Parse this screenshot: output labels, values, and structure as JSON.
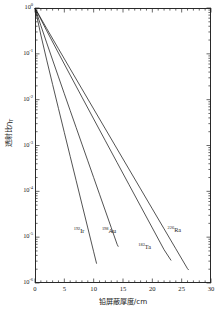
{
  "chart_data": {
    "type": "line",
    "title": "",
    "xlabel": "铅屏蔽厚度/cm",
    "ylabel": "透射比η",
    "ylabel_sub": "T",
    "xlim": [
      0,
      30
    ],
    "ylim": [
      1e-06,
      1
    ],
    "yscale": "log",
    "xscale": "linear",
    "grid": false,
    "legend_position": "inline-annotations",
    "xticks": [
      "0",
      "5",
      "10",
      "15",
      "20",
      "25",
      "30"
    ],
    "xtick_values": [
      0,
      5,
      10,
      15,
      20,
      25,
      30
    ],
    "yticks": [
      {
        "mantissa": "10",
        "exp": "0",
        "value": 1
      },
      {
        "mantissa": "10",
        "exp": "-1",
        "value": 0.1
      },
      {
        "mantissa": "10",
        "exp": "-2",
        "value": 0.01
      },
      {
        "mantissa": "10",
        "exp": "-3",
        "value": 0.001
      },
      {
        "mantissa": "10",
        "exp": "-4",
        "value": 0.0001
      },
      {
        "mantissa": "10",
        "exp": "-5",
        "value": 1e-05
      },
      {
        "mantissa": "10",
        "exp": "-6",
        "value": 1e-06
      }
    ],
    "series": [
      {
        "name": "Ir-192",
        "label_mass": "192",
        "label_element": "Ir",
        "label_x_cm": 6.6,
        "label_y_value": 1.3e-05,
        "x": [
          0,
          1,
          2,
          3,
          4,
          5,
          6,
          7,
          8,
          9,
          10,
          10.5
        ],
        "y": [
          1,
          0.257,
          0.073,
          0.0215,
          0.0064,
          0.00192,
          0.000578,
          0.0001745,
          5.27e-05,
          1.59e-05,
          4.8e-06,
          2.64e-06
        ]
      },
      {
        "name": "Au-198",
        "label_mass": "198",
        "label_element": "Au",
        "label_x_cm": 11.4,
        "label_y_value": 1.3e-05,
        "x": [
          0,
          1,
          2,
          3,
          4,
          5,
          6,
          7,
          8,
          9,
          10,
          11,
          12,
          13,
          14,
          14.2
        ],
        "y": [
          1,
          0.412,
          0.173,
          0.0735,
          0.0314,
          0.01345,
          0.00578,
          0.00249,
          0.001073,
          0.000463,
          0.0002,
          8.64e-05,
          3.73e-05,
          1.61e-05,
          6.97e-06,
          6.2e-06
        ]
      },
      {
        "name": "Ta-182",
        "label_mass": "182",
        "label_element": "Ta",
        "label_x_cm": 17.6,
        "label_y_value": 5.8e-06,
        "x": [
          0,
          2,
          4,
          6,
          8,
          10,
          12,
          14,
          16,
          18,
          20,
          22,
          23.2
        ],
        "y": [
          1,
          0.318,
          0.104,
          0.0343,
          0.01138,
          0.00379,
          0.001265,
          0.000423,
          0.0001415,
          4.74e-05,
          1.59e-05,
          5.33e-06,
          3.1e-06
        ]
      },
      {
        "name": "Ra-226",
        "label_mass": "226",
        "label_element": "Ra",
        "label_x_cm": 22.6,
        "label_y_value": 1.35e-05,
        "x": [
          0,
          2,
          4,
          6,
          8,
          10,
          12,
          14,
          16,
          18,
          20,
          22,
          24,
          26,
          26.2
        ],
        "y": [
          1,
          0.356,
          0.129,
          0.047,
          0.01715,
          0.00627,
          0.002295,
          0.00084,
          0.000308,
          0.0001129,
          4.14e-05,
          1.52e-05,
          5.58e-06,
          2.05e-06,
          1.92e-06
        ]
      }
    ]
  },
  "axes": {
    "x_title": "铅屏蔽厚度/cm",
    "y_title_main": "透射比η",
    "y_title_sub": "T"
  }
}
